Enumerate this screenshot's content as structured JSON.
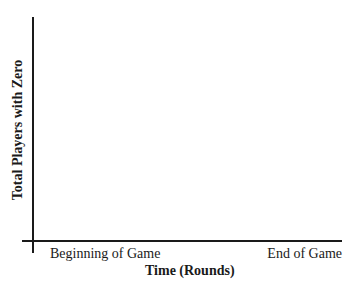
{
  "chart_data": {
    "type": "line",
    "title": "",
    "xlabel": "Time (Rounds)",
    "ylabel": "Total Players with Zero",
    "x_tick_labels": [
      "Beginning of Game",
      "End of Game"
    ],
    "series": [],
    "grid": false,
    "legend": null,
    "note": "Blank axes template; no data plotted"
  }
}
